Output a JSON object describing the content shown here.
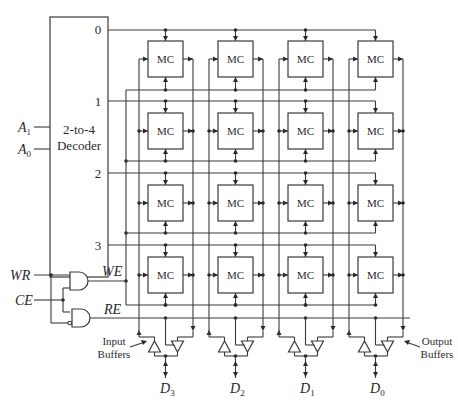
{
  "diagram": {
    "decoder": {
      "label_line1": "2-to-4",
      "label_line2": "Decoder",
      "inputs": [
        {
          "name": "A",
          "sub": "1"
        },
        {
          "name": "A",
          "sub": "0"
        }
      ],
      "outputs": [
        "0",
        "1",
        "2",
        "3"
      ]
    },
    "cell_label": "MC",
    "rows": 4,
    "columns": 4,
    "control": {
      "inputs": [
        "WR",
        "CE"
      ],
      "outputs": [
        "WE",
        "RE"
      ]
    },
    "buffers": {
      "input_label_line1": "Input",
      "input_label_line2": "Buffers",
      "output_label_line1": "Output",
      "output_label_line2": "Buffers"
    },
    "data_lines": [
      {
        "name": "D",
        "sub": "3"
      },
      {
        "name": "D",
        "sub": "2"
      },
      {
        "name": "D",
        "sub": "1"
      },
      {
        "name": "D",
        "sub": "0"
      }
    ],
    "colors": {
      "line": "#3a3a3a",
      "background": "#ffffff"
    }
  }
}
